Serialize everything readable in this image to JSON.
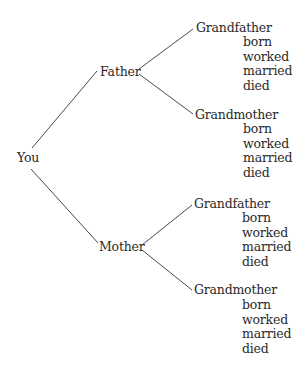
{
  "diagram": {
    "type": "family-tree",
    "root": {
      "label": "You"
    },
    "parents": [
      {
        "label": "Father",
        "grandparents": [
          {
            "label": "Grandfather",
            "facts": [
              "born",
              "worked",
              "married",
              "died"
            ]
          },
          {
            "label": "Grandmother",
            "facts": [
              "born",
              "worked",
              "married",
              "died"
            ]
          }
        ]
      },
      {
        "label": "Mother",
        "grandparents": [
          {
            "label": "Grandfather",
            "facts": [
              "born",
              "worked",
              "married",
              "died"
            ]
          },
          {
            "label": "Grandmother",
            "facts": [
              "born",
              "worked",
              "married",
              "died"
            ]
          }
        ]
      }
    ],
    "colors": {
      "text": "#2a2a2a",
      "line": "#4a4a4a",
      "background": "#ffffff"
    }
  }
}
